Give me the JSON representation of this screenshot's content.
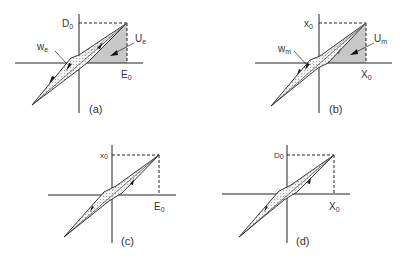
{
  "panels": [
    {
      "id": "a",
      "caption": "(a)",
      "y_label": "D",
      "y_label_sub": "0",
      "x_label": "E",
      "x_label_sub": "0",
      "loop_label": "w",
      "loop_label_sub": "e",
      "area_label": "U",
      "area_label_sub": "e",
      "shaded_energy_triangle": true
    },
    {
      "id": "b",
      "caption": "(b)",
      "y_label": "x",
      "y_label_sub": "0",
      "x_label": "X",
      "x_label_sub": "0",
      "loop_label": "w",
      "loop_label_sub": "m",
      "area_label": "U",
      "area_label_sub": "m",
      "shaded_energy_triangle": true
    },
    {
      "id": "c",
      "caption": "(c)",
      "y_label": "x",
      "y_label_sub": "0",
      "x_label": "E",
      "x_label_sub": "0",
      "shaded_energy_triangle": false
    },
    {
      "id": "d",
      "caption": "(d)",
      "y_label": "D",
      "y_label_sub": "0",
      "x_label": "X",
      "x_label_sub": "0",
      "shaded_energy_triangle": false
    }
  ],
  "colors": {
    "line": "#222222",
    "shade": "#c8c8c8",
    "loop_fill": "#f2f2f2"
  }
}
